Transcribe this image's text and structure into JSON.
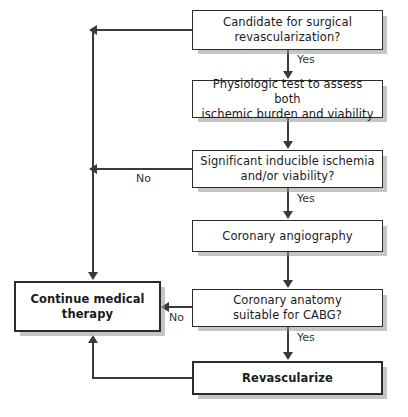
{
  "diagram": {
    "nodes": [
      {
        "id": "candidate",
        "line1": "Candidate for surgical",
        "line2": "revascularization?",
        "emphasis": "normal"
      },
      {
        "id": "physiologic-test",
        "line1": "Physiologic test to assess both",
        "line2": "ischemic burden and viability",
        "emphasis": "normal"
      },
      {
        "id": "significant-ischemia",
        "line1": "Significant inducible ischemia",
        "line2": "and/or viability?",
        "emphasis": "normal"
      },
      {
        "id": "coronary-angiography",
        "line1": "Coronary angiography",
        "line2": "",
        "emphasis": "normal"
      },
      {
        "id": "anatomy-suitable",
        "line1": "Coronary anatomy",
        "line2": "suitable for CABG?",
        "emphasis": "normal"
      },
      {
        "id": "revascularize",
        "line1": "Revascularize",
        "line2": "",
        "emphasis": "bold"
      },
      {
        "id": "continue-medical-therapy",
        "line1": "Continue medical",
        "line2": "therapy",
        "emphasis": "bold"
      }
    ],
    "edge_labels": {
      "yes_1": "Yes",
      "yes_2": "Yes",
      "yes_3": "Yes",
      "no_1": "No",
      "no_2": "No"
    },
    "colors": {
      "box_border": "#2b2b2b",
      "box_fill": "#ffffff",
      "line": "#3a3a3a",
      "shadow": "#969696",
      "text": "#1a1a1a",
      "background": "#ffffff"
    }
  }
}
